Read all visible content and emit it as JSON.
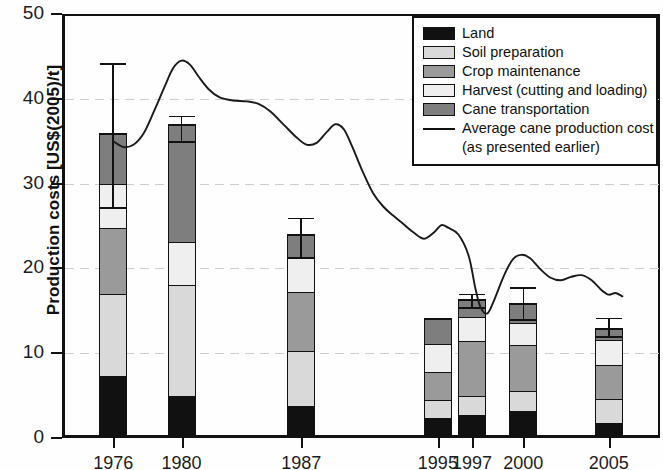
{
  "chart_data": {
    "type": "bar",
    "title": "",
    "xlabel": "",
    "ylabel": "Production costs [US$(2005)/t]",
    "ylim": [
      0,
      50
    ],
    "yticks": [
      0,
      10,
      20,
      30,
      40,
      50
    ],
    "grid": true,
    "stacked": true,
    "categories": [
      "1976",
      "1980",
      "1987",
      "1995",
      "1997",
      "2000",
      "2005"
    ],
    "x": [
      1976,
      1980,
      1987,
      1995,
      1997,
      2000,
      2005
    ],
    "xlim": [
      1973,
      2008
    ],
    "series": [
      {
        "name": "Land",
        "color": "#111111",
        "values": [
          7.3,
          4.9,
          3.7,
          2.3,
          2.6,
          3.1,
          1.7
        ]
      },
      {
        "name": "Soil preparation",
        "color": "#d9d9d9",
        "values": [
          9.7,
          13.1,
          6.6,
          2.1,
          2.3,
          2.4,
          2.9
        ]
      },
      {
        "name": "Crop maintenance",
        "color": "#9a9a9a",
        "values": [
          7.8,
          0.0,
          7.0,
          3.4,
          6.6,
          5.5,
          4.0
        ]
      },
      {
        "name": "Harvest (cutting and loading)",
        "color": "#efefef",
        "values": [
          5.2,
          5.2,
          4.0,
          3.3,
          2.8,
          2.6,
          3.0
        ]
      },
      {
        "name": "Cane transportation",
        "color": "#7e7e7e",
        "values": [
          6.0,
          13.8,
          2.7,
          3.1,
          2.1,
          2.3,
          1.4
        ]
      }
    ],
    "totals": [
      36.0,
      37.0,
      24.0,
      14.2,
      16.4,
      15.9,
      13.0
    ],
    "error_bars": [
      {
        "category": "1976",
        "value": 36.0,
        "upper": 44.2,
        "lower": 27.2
      },
      {
        "category": "1980",
        "value": 37.0,
        "upper": 38.0,
        "lower": 35.0
      },
      {
        "category": "1987",
        "value": 24.0,
        "upper": 26.0,
        "lower": 21.3
      },
      {
        "category": "1997",
        "value": 16.4,
        "upper": 17.0,
        "lower": 15.4
      },
      {
        "category": "2000",
        "value": 15.9,
        "upper": 17.8,
        "lower": 14.0
      },
      {
        "category": "2005",
        "value": 13.0,
        "upper": 14.2,
        "lower": 12.0
      }
    ],
    "line_series": {
      "name": "Average cane production cost (as presented earlier)",
      "color": "#1a1a1a",
      "points": [
        [
          1976.0,
          35.0
        ],
        [
          1976.6,
          34.3
        ],
        [
          1977.2,
          34.6
        ],
        [
          1977.8,
          36.0
        ],
        [
          1978.4,
          38.6
        ],
        [
          1979.0,
          41.4
        ],
        [
          1979.5,
          43.6
        ],
        [
          1980.0,
          44.5
        ],
        [
          1980.5,
          44.0
        ],
        [
          1981.0,
          42.6
        ],
        [
          1981.6,
          41.1
        ],
        [
          1982.2,
          40.2
        ],
        [
          1983.0,
          39.8
        ],
        [
          1983.8,
          39.7
        ],
        [
          1984.5,
          39.4
        ],
        [
          1985.2,
          38.5
        ],
        [
          1986.0,
          36.9
        ],
        [
          1986.7,
          35.5
        ],
        [
          1987.3,
          34.6
        ],
        [
          1987.9,
          34.8
        ],
        [
          1988.5,
          36.1
        ],
        [
          1989.0,
          37.0
        ],
        [
          1989.5,
          36.4
        ],
        [
          1990.0,
          34.3
        ],
        [
          1990.6,
          31.4
        ],
        [
          1991.2,
          28.9
        ],
        [
          1991.8,
          27.3
        ],
        [
          1992.4,
          26.2
        ],
        [
          1993.0,
          25.2
        ],
        [
          1993.6,
          24.2
        ],
        [
          1994.2,
          23.5
        ],
        [
          1994.8,
          24.3
        ],
        [
          1995.2,
          25.1
        ],
        [
          1995.6,
          24.8
        ],
        [
          1996.2,
          24.0
        ],
        [
          1996.8,
          21.5
        ],
        [
          1997.2,
          17.6
        ],
        [
          1997.5,
          15.4
        ],
        [
          1997.9,
          14.7
        ],
        [
          1998.3,
          16.3
        ],
        [
          1998.9,
          19.3
        ],
        [
          1999.4,
          21.1
        ],
        [
          1999.9,
          21.6
        ],
        [
          2000.4,
          21.2
        ],
        [
          2001.0,
          19.9
        ],
        [
          2001.6,
          18.9
        ],
        [
          2002.2,
          18.6
        ],
        [
          2002.8,
          19.0
        ],
        [
          2003.4,
          19.2
        ],
        [
          2004.0,
          18.6
        ],
        [
          2004.6,
          17.4
        ],
        [
          2005.0,
          16.9
        ],
        [
          2005.4,
          17.1
        ],
        [
          2005.8,
          16.7
        ]
      ]
    },
    "legend": {
      "position": "top-right",
      "entries": [
        {
          "label": "Land",
          "swatch": "#111111",
          "type": "swatch"
        },
        {
          "label": "Soil preparation",
          "swatch": "#d9d9d9",
          "type": "swatch"
        },
        {
          "label": "Crop maintenance",
          "swatch": "#9a9a9a",
          "type": "swatch"
        },
        {
          "label": "Harvest (cutting and loading)",
          "swatch": "#efefef",
          "type": "swatch"
        },
        {
          "label": "Cane transportation",
          "swatch": "#7e7e7e",
          "type": "swatch"
        },
        {
          "label": "Average cane production cost",
          "swatch": "#1a1a1a",
          "type": "line"
        }
      ],
      "continuation": "(as presented earlier)"
    }
  }
}
